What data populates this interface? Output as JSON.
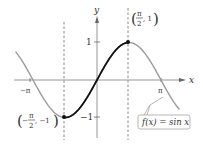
{
  "chart_data": {
    "type": "line",
    "title": "",
    "xlabel": "x",
    "ylabel": "y",
    "function": "f(x) = sin x",
    "x_ticks": [
      {
        "value": -3.14159,
        "label": "-π"
      },
      {
        "value": 3.14159,
        "label": "π"
      }
    ],
    "y_ticks": [
      {
        "value": 1,
        "label": "1"
      },
      {
        "value": -1,
        "label": "−1"
      }
    ],
    "xlim": [
      -4.2,
      4.3
    ],
    "ylim": [
      -1.6,
      1.6
    ],
    "grid": false,
    "series": [
      {
        "name": "sin x (full)",
        "color": "#999999",
        "x_range": [
          -4.0,
          4.05
        ]
      },
      {
        "name": "sin x on [-π/2, π/2]",
        "color": "#111111",
        "x_range": [
          -1.5708,
          1.5708
        ]
      }
    ],
    "points": [
      {
        "x": -1.5708,
        "y": -1,
        "label_num": "π",
        "label_den": "2",
        "label_sign": "−",
        "label_y": "−1"
      },
      {
        "x": 1.5708,
        "y": 1,
        "label_num": "π",
        "label_den": "2",
        "label_sign": "",
        "label_y": "1"
      }
    ],
    "vertical_dashed_lines": [
      -1.5708,
      1.5708
    ],
    "annotation": "f(x) = sin x"
  },
  "labels": {
    "y_axis": "y",
    "x_axis": "x",
    "neg_pi": "−π",
    "pi": "π",
    "one": "1",
    "neg_one": "−1",
    "func": "f(x) = sin x",
    "pt_max_num": "π",
    "pt_max_den": "2",
    "pt_max_y": ", 1",
    "pt_min_sign": "−",
    "pt_min_num": "π",
    "pt_min_den": "2",
    "pt_min_y": ", −1"
  }
}
